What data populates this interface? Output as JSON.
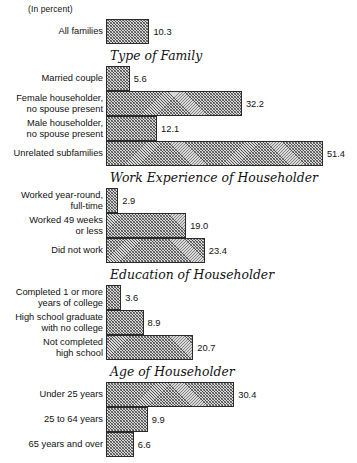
{
  "figure": {
    "unit_note": "(In percent)",
    "scale_px_per_unit": 4.22,
    "baseline_x": 108
  },
  "chart_data": {
    "type": "bar",
    "orientation": "horizontal",
    "title": "",
    "subtitle": "(In percent)",
    "xlabel": "percent",
    "ylabel": "",
    "xlim": [
      0,
      55
    ],
    "grid": false,
    "legend": null,
    "value_labels": true,
    "categories": [
      "All families",
      "Married couple",
      "Female householder, no spouse present",
      "Male householder, no spouse present",
      "Unrelated subfamilies",
      "Worked year-round, full-time",
      "Worked 49 weeks or less",
      "Did not work",
      "Completed 1 or more years of college",
      "High school graduate with no college",
      "Not completed high school",
      "Under 25 years",
      "25 to 64 years",
      "65 years and over"
    ],
    "values": [
      10.3,
      5.6,
      32.2,
      12.1,
      51.4,
      2.9,
      19.0,
      23.4,
      3.6,
      8.9,
      20.7,
      30.4,
      9.9,
      6.6
    ],
    "groups": [
      {
        "heading": "",
        "bars": [
          {
            "label": "All families",
            "label_lines": "All families",
            "value": 10.3,
            "value_text": "10.3",
            "top": 19
          }
        ]
      },
      {
        "heading": "Type of Family",
        "heading_top": 48,
        "bars": [
          {
            "label": "Married couple",
            "label_lines": "Married couple",
            "value": 5.6,
            "value_text": "5.6",
            "top": 66
          },
          {
            "label": "Female householder, no spouse present",
            "label_lines": "Female householder,\nno spouse present",
            "value": 32.2,
            "value_text": "32.2",
            "top": 91
          },
          {
            "label": "Male householder, no spouse present",
            "label_lines": "Male householder,\nno spouse present",
            "value": 12.1,
            "value_text": "12.1",
            "top": 116
          },
          {
            "label": "Unrelated subfamilies",
            "label_lines": "Unrelated subfamilies",
            "value": 51.4,
            "value_text": "51.4",
            "top": 141
          }
        ]
      },
      {
        "heading": "Work Experience of Householder",
        "heading_top": 170,
        "bars": [
          {
            "label": "Worked year-round, full-time",
            "label_lines": "Worked year-round,\nfull-time",
            "value": 2.9,
            "value_text": "2.9",
            "top": 188
          },
          {
            "label": "Worked 49 weeks or less",
            "label_lines": "Worked 49 weeks\nor less",
            "value": 19.0,
            "value_text": "19.0",
            "top": 213
          },
          {
            "label": "Did not work",
            "label_lines": "Did not work",
            "value": 23.4,
            "value_text": "23.4",
            "top": 238
          }
        ]
      },
      {
        "heading": "Education of Householder",
        "heading_top": 267,
        "bars": [
          {
            "label": "Completed 1 or more years of college",
            "label_lines": "Completed 1 or more\nyears of college",
            "value": 3.6,
            "value_text": "3.6",
            "top": 285
          },
          {
            "label": "High school graduate with no college",
            "label_lines": "High school graduate\nwith no college",
            "value": 8.9,
            "value_text": "8.9",
            "top": 310
          },
          {
            "label": "Not completed high school",
            "label_lines": "Not completed\nhigh school",
            "value": 20.7,
            "value_text": "20.7",
            "top": 335
          }
        ]
      },
      {
        "heading": "Age of Householder",
        "heading_top": 364,
        "bars": [
          {
            "label": "Under 25 years",
            "label_lines": "Under 25 years",
            "value": 30.4,
            "value_text": "30.4",
            "top": 382
          },
          {
            "label": "25 to 64 years",
            "label_lines": "25 to 64 years",
            "value": 9.9,
            "value_text": "9.9",
            "top": 407
          },
          {
            "label": "65 years and over",
            "label_lines": "65 years and over",
            "value": 6.6,
            "value_text": "6.6",
            "top": 432
          }
        ]
      }
    ]
  }
}
